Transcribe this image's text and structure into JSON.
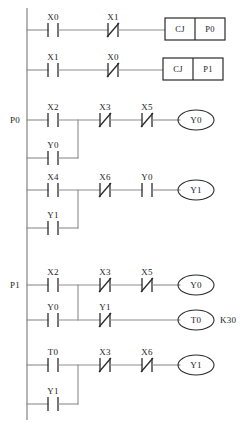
{
  "diagram": {
    "type": "ladder-logic",
    "line_color": "#8d8d8d",
    "symbol_color": "#2b2b2b",
    "background": "#ffffff"
  },
  "rail_labels": [
    {
      "text": "P0",
      "x": 16,
      "y": 120
    },
    {
      "text": "P1",
      "x": 16,
      "y": 285
    }
  ],
  "rungs": [
    {
      "id": "rung-1",
      "label": "",
      "y": 30,
      "contacts": [
        {
          "name": "X0",
          "type": "NO",
          "x": 53
        },
        {
          "name": "X1",
          "type": "NC",
          "x": 113
        }
      ],
      "output": {
        "kind": "box",
        "fields": [
          "CJ",
          "P0"
        ]
      }
    },
    {
      "id": "rung-2",
      "label": "",
      "y": 70,
      "contacts": [
        {
          "name": "X1",
          "type": "NO",
          "x": 53
        },
        {
          "name": "X0",
          "type": "NC",
          "x": 113
        }
      ],
      "output": {
        "kind": "box",
        "fields": [
          "CJ",
          "P1"
        ]
      }
    },
    {
      "id": "rung-3",
      "label": "P0",
      "y": 120,
      "contacts": [
        {
          "name": "X2",
          "type": "NO",
          "x": 53
        },
        {
          "name": "X3",
          "type": "NC",
          "x": 105
        },
        {
          "name": "X5",
          "type": "NC",
          "x": 147
        }
      ],
      "branch": {
        "y": 158,
        "contact": {
          "name": "Y0",
          "type": "NO",
          "x": 53
        },
        "join_x": 78
      },
      "output": {
        "kind": "coil",
        "name": "Y0"
      }
    },
    {
      "id": "rung-4",
      "label": "",
      "y": 190,
      "contacts": [
        {
          "name": "X4",
          "type": "NO",
          "x": 53
        },
        {
          "name": "X6",
          "type": "NC",
          "x": 105
        },
        {
          "name": "Y0",
          "type": "NO",
          "x": 147
        }
      ],
      "branch": {
        "y": 228,
        "contact": {
          "name": "Y1",
          "type": "NO",
          "x": 53
        },
        "join_x": 78
      },
      "output": {
        "kind": "coil",
        "name": "Y1"
      }
    },
    {
      "id": "rung-5",
      "label": "P1",
      "y": 285,
      "contacts": [
        {
          "name": "X2",
          "type": "NO",
          "x": 53
        },
        {
          "name": "X3",
          "type": "NC",
          "x": 105
        },
        {
          "name": "X5",
          "type": "NC",
          "x": 147
        }
      ],
      "branch": {
        "y": 320,
        "contact": {
          "name": "Y0",
          "type": "NO",
          "x": 53
        },
        "join_x": 78,
        "second_contact": {
          "name": "Y1",
          "type": "NC",
          "x": 105
        },
        "output": {
          "kind": "coil",
          "name": "T0",
          "preset": "K30"
        }
      },
      "output": {
        "kind": "coil",
        "name": "Y0"
      }
    },
    {
      "id": "rung-6",
      "label": "",
      "y": 365,
      "contacts": [
        {
          "name": "T0",
          "type": "NO",
          "x": 53
        },
        {
          "name": "X3",
          "type": "NC",
          "x": 105
        },
        {
          "name": "X6",
          "type": "NC",
          "x": 147
        }
      ],
      "branch": {
        "y": 404,
        "contact": {
          "name": "Y1",
          "type": "NO",
          "x": 53
        },
        "join_x": 78
      },
      "output": {
        "kind": "coil",
        "name": "Y1"
      }
    }
  ],
  "labels": {
    "rung1_c1": "X0",
    "rung1_c2": "X1",
    "rung1_box1": "CJ",
    "rung1_box2": "P0",
    "rung2_c1": "X1",
    "rung2_c2": "X0",
    "rung2_box1": "CJ",
    "rung2_box2": "P1",
    "rung3_rail": "P0",
    "rung3_c1": "X2",
    "rung3_c2": "X3",
    "rung3_c3": "X5",
    "rung3_b1": "Y0",
    "rung3_coil": "Y0",
    "rung4_c1": "X4",
    "rung4_c2": "X6",
    "rung4_c3": "Y0",
    "rung4_b1": "Y1",
    "rung4_coil": "Y1",
    "rung5_rail": "P1",
    "rung5_c1": "X2",
    "rung5_c2": "X3",
    "rung5_c3": "X5",
    "rung5_b1": "Y0",
    "rung5_b2": "Y1",
    "rung5_coil": "Y0",
    "rung5_timer": "T0",
    "rung5_preset": "K30",
    "rung6_c1": "T0",
    "rung6_c2": "X3",
    "rung6_c3": "X6",
    "rung6_b1": "Y1",
    "rung6_coil": "Y1"
  }
}
